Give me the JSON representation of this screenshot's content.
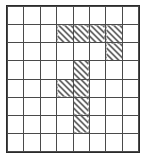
{
  "figure": {
    "title": "",
    "type": "grid-pattern",
    "rows": 8,
    "columns": 8,
    "legend": {
      "empty": "empty cell",
      "gray": "solid gray filled cell",
      "hatch": "diagonally hatched cell"
    },
    "colors": {
      "background": "#ffffff",
      "frame_border": "#2b2b2b",
      "cell_border": "#4a4a4a",
      "gray_fill": "#a8a8a8",
      "hatch_line": "#3a3a3a"
    }
  },
  "chart_data": {
    "type": "heatmap",
    "title": "",
    "xlabel": "",
    "ylabel": "",
    "categories": [
      "c0",
      "c1",
      "c2",
      "c3",
      "c4",
      "c5",
      "c6",
      "c7"
    ],
    "row_labels": [
      "r0",
      "r1",
      "r2",
      "r3",
      "r4",
      "r5",
      "r6",
      "r7"
    ],
    "states": [
      "empty",
      "gray",
      "hatch"
    ],
    "grid": [
      [
        "empty",
        "empty",
        "empty",
        "empty",
        "empty",
        "empty",
        "empty",
        "empty"
      ],
      [
        "empty",
        "gray",
        "gray",
        "hatch",
        "hatch",
        "hatch",
        "hatch",
        "empty"
      ],
      [
        "empty",
        "empty",
        "gray",
        "empty",
        "empty",
        "empty",
        "hatch",
        "empty"
      ],
      [
        "empty",
        "gray",
        "gray",
        "empty",
        "hatch",
        "empty",
        "gray",
        "empty"
      ],
      [
        "empty",
        "empty",
        "empty",
        "hatch",
        "hatch",
        "empty",
        "gray",
        "empty"
      ],
      [
        "gray",
        "gray",
        "gray",
        "empty",
        "hatch",
        "empty",
        "gray",
        "empty"
      ],
      [
        "empty",
        "empty",
        "gray",
        "empty",
        "hatch",
        "empty",
        "gray",
        "empty"
      ],
      [
        "empty",
        "empty",
        "gray",
        "empty",
        "empty",
        "empty",
        "gray",
        "empty"
      ]
    ]
  }
}
